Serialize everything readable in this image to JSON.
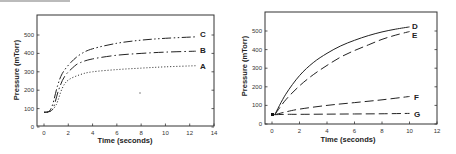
{
  "chart_data": [
    {
      "type": "line",
      "title": "",
      "xlabel": "Time (seconds)",
      "ylabel": "Pressure (mTorr)",
      "xlim": [
        0,
        14
      ],
      "ylim": [
        0,
        600
      ],
      "xticks": [
        0,
        2,
        4,
        6,
        8,
        10,
        12,
        14
      ],
      "yticks": [
        0,
        100,
        200,
        300,
        400,
        500
      ],
      "grid": false,
      "legend": "inline labels at right end of curves",
      "series": [
        {
          "name": "A",
          "style": "dotted",
          "x": [
            0,
            0.5,
            1.0,
            1.5,
            2,
            3,
            4,
            6,
            8,
            10,
            12.5
          ],
          "y": [
            80,
            85,
            120,
            210,
            255,
            285,
            300,
            312,
            320,
            327,
            333
          ]
        },
        {
          "name": "B",
          "style": "long-dash-dot",
          "x": [
            0,
            0.5,
            0.8,
            1.2,
            1.7,
            2.5,
            3,
            4,
            6,
            8,
            10,
            12.5
          ],
          "y": [
            80,
            85,
            110,
            200,
            275,
            330,
            350,
            370,
            390,
            400,
            407,
            412
          ]
        },
        {
          "name": "C",
          "style": "dash-dot-dot",
          "x": [
            0,
            0.4,
            0.7,
            1.1,
            1.5,
            2.2,
            3,
            4,
            6,
            8,
            10,
            12.5
          ],
          "y": [
            80,
            85,
            120,
            220,
            290,
            350,
            395,
            425,
            455,
            472,
            482,
            490
          ]
        }
      ]
    },
    {
      "type": "line",
      "title": "",
      "xlabel": "Time (seconds)",
      "ylabel": "Pressure (mTorr)",
      "xlim": [
        0,
        12
      ],
      "ylim": [
        0,
        600
      ],
      "xticks": [
        0,
        2,
        4,
        6,
        8,
        10,
        12
      ],
      "yticks": [
        0,
        100,
        200,
        300,
        400,
        500
      ],
      "grid": false,
      "legend": "inline labels at right end of curves",
      "series": [
        {
          "name": "D",
          "style": "solid",
          "x": [
            0.2,
            1,
            2,
            3,
            4,
            5,
            6,
            7,
            8,
            9,
            10
          ],
          "y": [
            50,
            160,
            260,
            330,
            380,
            420,
            450,
            475,
            495,
            510,
            522
          ]
        },
        {
          "name": "E",
          "style": "long-dash",
          "x": [
            0.2,
            1,
            2,
            3,
            4,
            5,
            6,
            7,
            8,
            9,
            10
          ],
          "y": [
            50,
            130,
            205,
            265,
            315,
            360,
            395,
            425,
            455,
            478,
            497
          ]
        },
        {
          "name": "F",
          "style": "long-dash",
          "x": [
            0.2,
            1,
            2,
            4,
            6,
            8,
            10
          ],
          "y": [
            50,
            65,
            80,
            100,
            115,
            130,
            148
          ]
        },
        {
          "name": "G",
          "style": "long-dash",
          "x": [
            0.2,
            1,
            2,
            4,
            6,
            8,
            10
          ],
          "y": [
            50,
            52,
            52,
            53,
            54,
            55,
            57
          ]
        }
      ]
    }
  ],
  "left": {
    "xlabel": "Time (seconds)",
    "ylabel": "Pressure (mTorr)",
    "xtick_labels": [
      "0",
      "2",
      "4",
      "6",
      "8",
      "10",
      "12",
      "14"
    ],
    "ytick_labels": [
      "0",
      "100",
      "200",
      "300",
      "400",
      "500"
    ],
    "labels": {
      "A": "A",
      "B": "B",
      "C": "C"
    }
  },
  "right": {
    "xlabel": "Time (seconds)",
    "ylabel": "Pressure (mTorr)",
    "xtick_labels": [
      "0",
      "2",
      "4",
      "6",
      "8",
      "10",
      "12"
    ],
    "ytick_labels": [
      "0",
      "100",
      "200",
      "300",
      "400",
      "500"
    ],
    "labels": {
      "D": "D",
      "E": "E",
      "F": "F",
      "G": "G"
    }
  }
}
